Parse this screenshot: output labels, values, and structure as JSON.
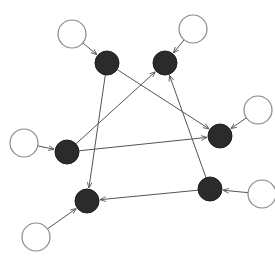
{
  "diagram": {
    "type": "directed-graph",
    "colors": {
      "background": "#ffffff",
      "dark_fill": "#2b2b2b",
      "light_fill": "#ffffff",
      "light_stroke": "#8a8a8a",
      "edge": "#555555"
    },
    "nodes": [
      {
        "id": "A",
        "kind": "dark",
        "x": 107,
        "y": 63,
        "r": 12
      },
      {
        "id": "B",
        "kind": "dark",
        "x": 165,
        "y": 63,
        "r": 12
      },
      {
        "id": "C",
        "kind": "dark",
        "x": 220,
        "y": 136,
        "r": 12
      },
      {
        "id": "D",
        "kind": "dark",
        "x": 67,
        "y": 152,
        "r": 12
      },
      {
        "id": "E",
        "kind": "dark",
        "x": 210,
        "y": 189,
        "r": 12
      },
      {
        "id": "F",
        "kind": "dark",
        "x": 87,
        "y": 201,
        "r": 12
      },
      {
        "id": "W1",
        "kind": "light",
        "x": 72,
        "y": 34,
        "r": 14
      },
      {
        "id": "W2",
        "kind": "light",
        "x": 193,
        "y": 29,
        "r": 14
      },
      {
        "id": "W3",
        "kind": "light",
        "x": 258,
        "y": 110,
        "r": 14
      },
      {
        "id": "W4",
        "kind": "light",
        "x": 24,
        "y": 143,
        "r": 14
      },
      {
        "id": "W5",
        "kind": "light",
        "x": 262,
        "y": 194,
        "r": 14
      },
      {
        "id": "W6",
        "kind": "light",
        "x": 36,
        "y": 237,
        "r": 14
      }
    ],
    "edges": [
      {
        "from": "W1",
        "to": "A"
      },
      {
        "from": "W2",
        "to": "B"
      },
      {
        "from": "W3",
        "to": "C"
      },
      {
        "from": "W4",
        "to": "D"
      },
      {
        "from": "W5",
        "to": "E"
      },
      {
        "from": "W6",
        "to": "F"
      },
      {
        "from": "A",
        "to": "C"
      },
      {
        "from": "A",
        "to": "F"
      },
      {
        "from": "D",
        "to": "B"
      },
      {
        "from": "D",
        "to": "C"
      },
      {
        "from": "E",
        "to": "B"
      },
      {
        "from": "E",
        "to": "F"
      }
    ]
  }
}
